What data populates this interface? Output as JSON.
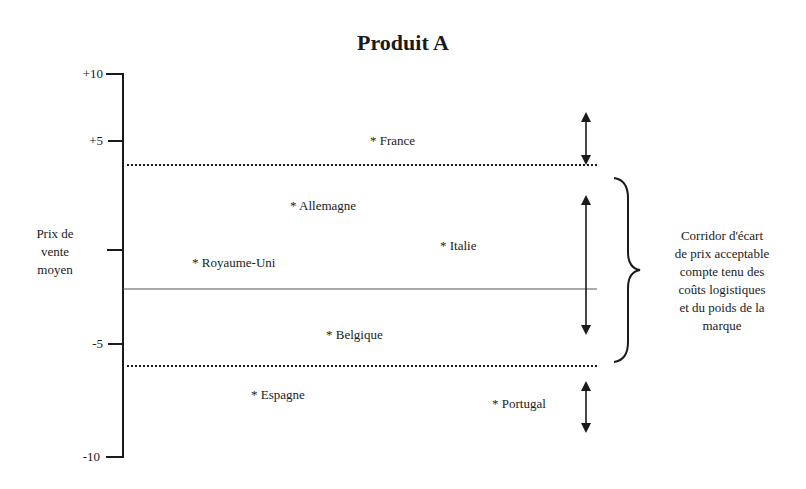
{
  "title": "Produit A",
  "y_axis": {
    "label_lines": [
      "Prix de",
      "vente",
      "moyen"
    ],
    "ticks": [
      {
        "label": "+10",
        "value": 10
      },
      {
        "label": "+5",
        "value": 5
      },
      {
        "label": "",
        "value": 0
      },
      {
        "label": "-5",
        "value": -5
      },
      {
        "label": "-10",
        "value": -10
      }
    ]
  },
  "countries": [
    {
      "label": "* France"
    },
    {
      "label": "* Allemagne"
    },
    {
      "label": "* Italie"
    },
    {
      "label": "* Royaume-Uni"
    },
    {
      "label": "* Belgique"
    },
    {
      "label": "* Espagne"
    },
    {
      "label": "* Portugal"
    }
  ],
  "corridor_note": {
    "lines": [
      "Corridor d'écart",
      "de prix acceptable",
      "compte tenu des",
      "coûts logistiques",
      "et du poids de la",
      "marque"
    ]
  },
  "colors": {
    "ink": "#1a1a1a",
    "background": "#ffffff"
  }
}
